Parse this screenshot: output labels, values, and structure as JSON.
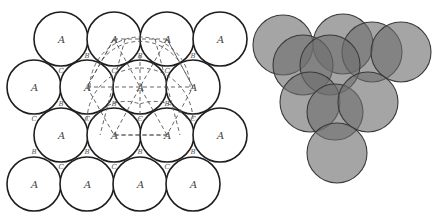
{
  "figure": {
    "left_panel": {
      "description": "Close-packed layer of spheres (top view) with A, B, C positions",
      "sphere_label": "A",
      "void_labels": [
        "B",
        "C"
      ],
      "radius": 27,
      "spheres": [
        {
          "x": 61,
          "y": 39,
          "label": "A"
        },
        {
          "x": 114,
          "y": 39,
          "label": "A"
        },
        {
          "x": 167,
          "y": 39,
          "label": "A"
        },
        {
          "x": 220,
          "y": 39,
          "label": "A"
        },
        {
          "x": 34,
          "y": 87,
          "label": "A"
        },
        {
          "x": 87,
          "y": 87,
          "label": "A"
        },
        {
          "x": 140,
          "y": 87,
          "label": "A"
        },
        {
          "x": 193,
          "y": 87,
          "label": "A"
        },
        {
          "x": 61,
          "y": 135,
          "label": "A"
        },
        {
          "x": 114,
          "y": 135,
          "label": "A"
        },
        {
          "x": 167,
          "y": 135,
          "label": "A"
        },
        {
          "x": 220,
          "y": 135,
          "label": "A"
        },
        {
          "x": 34,
          "y": 184,
          "label": "A"
        },
        {
          "x": 87,
          "y": 184,
          "label": "A"
        },
        {
          "x": 140,
          "y": 184,
          "label": "A"
        },
        {
          "x": 193,
          "y": 184,
          "label": "A"
        }
      ],
      "voids": [
        {
          "x": 87,
          "y": 55,
          "label": "B"
        },
        {
          "x": 140,
          "y": 55,
          "label": "B"
        },
        {
          "x": 193,
          "y": 55,
          "label": "B"
        },
        {
          "x": 61,
          "y": 70,
          "label": "C"
        },
        {
          "x": 114,
          "y": 70,
          "label": "C"
        },
        {
          "x": 167,
          "y": 70,
          "label": "C"
        },
        {
          "x": 61,
          "y": 103,
          "label": "B"
        },
        {
          "x": 114,
          "y": 103,
          "label": "B"
        },
        {
          "x": 167,
          "y": 103,
          "label": "B"
        },
        {
          "x": 34,
          "y": 118,
          "label": "C"
        },
        {
          "x": 87,
          "y": 118,
          "label": "C"
        },
        {
          "x": 140,
          "y": 118,
          "label": "C"
        },
        {
          "x": 193,
          "y": 118,
          "label": "C"
        },
        {
          "x": 34,
          "y": 151,
          "label": "B"
        },
        {
          "x": 87,
          "y": 151,
          "label": "B"
        },
        {
          "x": 140,
          "y": 151,
          "label": "B"
        },
        {
          "x": 193,
          "y": 151,
          "label": "B"
        },
        {
          "x": 61,
          "y": 166,
          "label": "C"
        },
        {
          "x": 114,
          "y": 166,
          "label": "C"
        },
        {
          "x": 167,
          "y": 166,
          "label": "C"
        }
      ],
      "dashed_hexagon_center": {
        "x": 140,
        "y": 87
      }
    },
    "right_panel": {
      "description": "Shaded overlapping spheres showing stacking of layers",
      "fill_color": "#6e6e6e",
      "spheres": [
        {
          "x": 283,
          "y": 45,
          "r": 30
        },
        {
          "x": 343,
          "y": 44,
          "r": 30
        },
        {
          "x": 372,
          "y": 52,
          "r": 30
        },
        {
          "x": 401,
          "y": 52,
          "r": 30
        },
        {
          "x": 303,
          "y": 65,
          "r": 30
        },
        {
          "x": 330,
          "y": 65,
          "r": 30
        },
        {
          "x": 310,
          "y": 102,
          "r": 30
        },
        {
          "x": 335,
          "y": 112,
          "r": 28
        },
        {
          "x": 368,
          "y": 102,
          "r": 30
        },
        {
          "x": 337,
          "y": 153,
          "r": 30
        }
      ]
    }
  }
}
